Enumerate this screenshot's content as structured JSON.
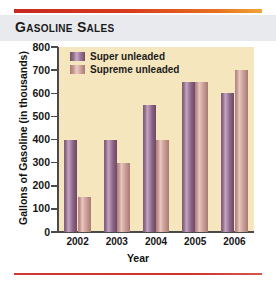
{
  "header": {
    "title": "Gasoline Sales"
  },
  "chart_data": {
    "type": "bar",
    "title": "Gasoline Sales",
    "categories": [
      "2002",
      "2003",
      "2004",
      "2005",
      "2006"
    ],
    "series": [
      {
        "name": "Super unleaded",
        "values": [
          400,
          400,
          550,
          650,
          600
        ],
        "color": "#96709a"
      },
      {
        "name": "Supreme unleaded",
        "values": [
          150,
          300,
          400,
          650,
          700
        ],
        "color": "#d4a9a1"
      }
    ],
    "xlabel": "Year",
    "ylabel": "Gallons of Gasoline (in thousands)",
    "ylim": [
      0,
      800
    ],
    "yticks": [
      0,
      100,
      200,
      300,
      400,
      500,
      600,
      700,
      800
    ],
    "ytick_labels": [
      "0",
      "100",
      "200",
      "300",
      "400",
      "500",
      "600",
      "700",
      "800"
    ],
    "grid": false,
    "legend_position": "top-left",
    "plot_background": "#f6e6bd",
    "accent_color": "#cf3228"
  }
}
